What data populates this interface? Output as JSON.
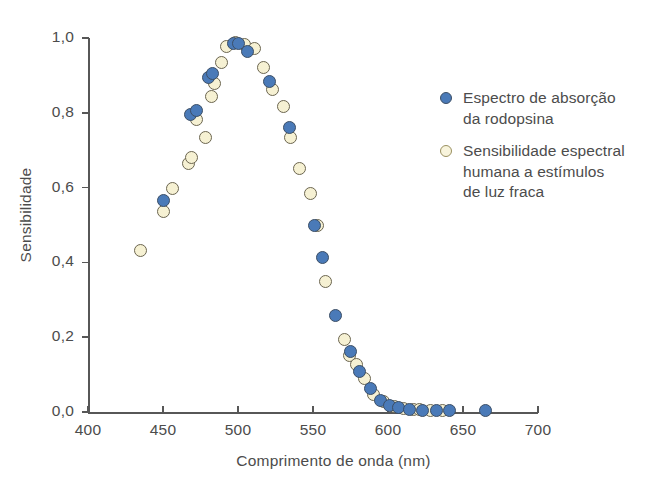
{
  "chart_data": {
    "type": "scatter",
    "title": "",
    "xlabel": "Comprimento de onda (nm)",
    "ylabel": "Sensibilidade",
    "xlim": [
      400,
      700
    ],
    "ylim": [
      0.0,
      1.0
    ],
    "xticks": [
      400,
      450,
      500,
      550,
      600,
      650,
      700
    ],
    "yticks": [
      0.0,
      0.2,
      0.4,
      0.6,
      0.8,
      1.0
    ],
    "xtick_labels": [
      "400",
      "450",
      "500",
      "550",
      "600",
      "650",
      "700"
    ],
    "ytick_labels": [
      "0,0",
      "0,2",
      "0,4",
      "0,6",
      "0,8",
      "1,0"
    ],
    "grid": false,
    "legend_position": "upper right",
    "decimal_separator": ",",
    "series": [
      {
        "name": "Espectro de absorção da rodopsina",
        "marker": "filled-circle",
        "color": "#4a7ab8",
        "edge_color": "#3c4f66",
        "points": [
          [
            450,
            0.565
          ],
          [
            468,
            0.795
          ],
          [
            472,
            0.805
          ],
          [
            480,
            0.895
          ],
          [
            483,
            0.905
          ],
          [
            497,
            0.985
          ],
          [
            500,
            0.985
          ],
          [
            506,
            0.965
          ],
          [
            521,
            0.885
          ],
          [
            534,
            0.76
          ],
          [
            551,
            0.5
          ],
          [
            556,
            0.413
          ],
          [
            565,
            0.258
          ],
          [
            575,
            0.163
          ],
          [
            581,
            0.108
          ],
          [
            588,
            0.063
          ],
          [
            595,
            0.031
          ],
          [
            601,
            0.018
          ],
          [
            607,
            0.012
          ],
          [
            614,
            0.008
          ],
          [
            623,
            0.005
          ],
          [
            632,
            0.004
          ],
          [
            641,
            0.003
          ],
          [
            665,
            0.003
          ]
        ]
      },
      {
        "name": "Sensibilidade espectral humana a estímulos de luz fraca",
        "marker": "open-circle",
        "color": "#f6f1d3",
        "edge_color": "#6b6550",
        "points": [
          [
            435,
            0.432
          ],
          [
            450,
            0.535
          ],
          [
            456,
            0.598
          ],
          [
            467,
            0.665
          ],
          [
            469,
            0.68
          ],
          [
            472,
            0.782
          ],
          [
            478,
            0.735
          ],
          [
            482,
            0.843
          ],
          [
            484,
            0.878
          ],
          [
            489,
            0.935
          ],
          [
            492,
            0.978
          ],
          [
            498,
            0.988
          ],
          [
            504,
            0.982
          ],
          [
            511,
            0.972
          ],
          [
            517,
            0.92
          ],
          [
            523,
            0.862
          ],
          [
            530,
            0.818
          ],
          [
            535,
            0.735
          ],
          [
            541,
            0.65
          ],
          [
            548,
            0.585
          ],
          [
            553,
            0.5
          ],
          [
            558,
            0.35
          ],
          [
            571,
            0.195
          ],
          [
            574,
            0.152
          ],
          [
            579,
            0.128
          ],
          [
            584,
            0.09
          ],
          [
            590,
            0.048
          ],
          [
            597,
            0.028
          ],
          [
            604,
            0.015
          ],
          [
            610,
            0.01
          ],
          [
            617,
            0.007
          ],
          [
            621,
            0.006
          ],
          [
            628,
            0.005
          ],
          [
            636,
            0.004
          ]
        ]
      }
    ]
  },
  "legend": {
    "items": [
      {
        "label": "Espectro de absorção\nda rodopsina",
        "swatch": "blue"
      },
      {
        "label": "Sensibilidade espectral\nhumana a estímulos\nde luz fraca",
        "swatch": "cream"
      }
    ]
  },
  "colors": {
    "blue": "#4a7ab8",
    "cream": "#f6f1d3",
    "axis": "#575757",
    "text": "#4c4c4c",
    "background": "#ffffff"
  }
}
